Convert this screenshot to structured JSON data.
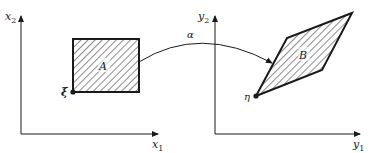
{
  "diagram": {
    "type": "mapping",
    "left_panel": {
      "x_axis_label": "x",
      "x_axis_sub": "1",
      "y_axis_label": "x",
      "y_axis_sub": "2",
      "region_label": "A",
      "point_label": "ξ"
    },
    "right_panel": {
      "x_axis_label": "y",
      "x_axis_sub": "1",
      "y_axis_label": "y",
      "y_axis_sub": "2",
      "region_label": "B",
      "point_label": "η"
    },
    "mapping_label": "α",
    "colors": {
      "stroke": "#1a1a1a",
      "background": "#ffffff"
    }
  }
}
